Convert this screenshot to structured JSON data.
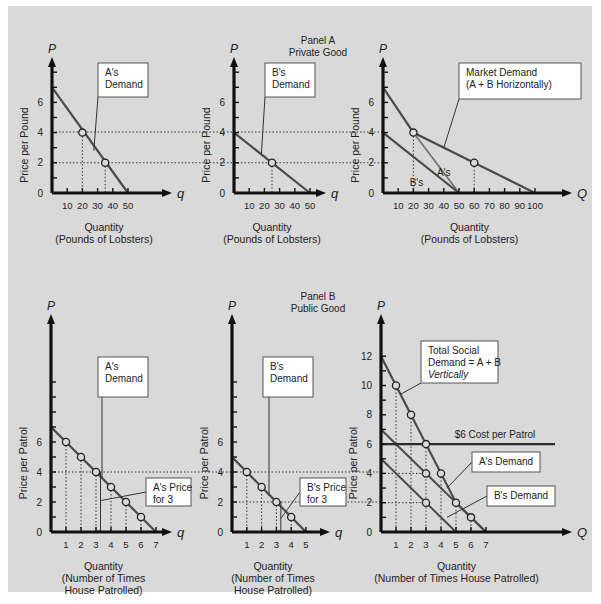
{
  "background": {
    "outer": "#ffffff",
    "panel": "#d9d9d9",
    "line": "#4a4a4a",
    "axis": "#111111",
    "box_fill": "#ffffff",
    "box_stroke": "#555555"
  },
  "panel_titles": [
    {
      "id": "panel-a",
      "lines": [
        "Panel A",
        "Private Good"
      ],
      "x": 318,
      "y": 44
    },
    {
      "id": "panel-b",
      "lines": [
        "Panel B",
        "Public Good"
      ],
      "x": 318,
      "y": 300
    }
  ],
  "chart_data": [
    {
      "id": "a-private-demand",
      "type": "line",
      "title": "A's Demand (Private Good)",
      "ylabel": "Price per Pound",
      "xlabel": "Quantity\n(Pounds of Lobsters)",
      "axis_y_label": "P",
      "axis_x_label": "q",
      "xlim": [
        0,
        50
      ],
      "ylim": [
        0,
        7
      ],
      "xticks": [
        10,
        20,
        30,
        40,
        50
      ],
      "yticks_labeled": [
        0,
        2,
        4,
        6
      ],
      "yticks_minor": [
        1,
        3,
        5,
        7,
        8
      ],
      "series": [
        {
          "name": "A's Demand",
          "points": [
            [
              0,
              7
            ],
            [
              50,
              0
            ]
          ]
        }
      ],
      "markers": [
        [
          20,
          4
        ],
        [
          35,
          2
        ]
      ],
      "guides": [
        {
          "type": "v",
          "x": 20,
          "y": 4
        },
        {
          "type": "v",
          "x": 35,
          "y": 2
        }
      ],
      "annotations": [
        {
          "lines": [
            "A's",
            "Demand"
          ],
          "box": [
            98,
            63,
            50,
            34
          ],
          "pointer_to": [
            27.5,
            2.8
          ]
        }
      ],
      "frame": {
        "ox": 52,
        "oy": 193,
        "px_x": 1.52,
        "px_y": 15.1,
        "top": 57,
        "right": 172
      }
    },
    {
      "id": "b-private-demand",
      "type": "line",
      "title": "B's Demand (Private Good)",
      "ylabel": "Price per Pound",
      "xlabel": "Quantity\n(Pounds of Lobsters)",
      "axis_y_label": "P",
      "axis_x_label": "q",
      "xlim": [
        0,
        50
      ],
      "ylim": [
        0,
        4
      ],
      "xticks": [
        10,
        20,
        30,
        40,
        50
      ],
      "yticks_labeled": [
        0,
        2,
        4,
        6
      ],
      "yticks_minor": [
        1,
        3,
        5,
        7,
        8
      ],
      "series": [
        {
          "name": "B's Demand",
          "points": [
            [
              0,
              4
            ],
            [
              50,
              0
            ]
          ]
        }
      ],
      "markers": [
        [
          25,
          2
        ]
      ],
      "guides": [
        {
          "type": "v",
          "x": 25,
          "y": 2
        }
      ],
      "annotations": [
        {
          "lines": [
            "B's",
            "Demand"
          ],
          "box": [
            265,
            63,
            50,
            34
          ],
          "pointer_to": [
            18,
            2.6
          ]
        }
      ],
      "frame": {
        "ox": 234,
        "oy": 193,
        "px_x": 1.52,
        "px_y": 15.1,
        "top": 57,
        "right": 326
      }
    },
    {
      "id": "market-demand-private",
      "type": "line",
      "title": "Market Demand (A + B Horizontally)",
      "ylabel": "Price per Pound",
      "xlabel": "Quantity\n(Pounds of Lobsters)",
      "axis_y_label": "P",
      "axis_x_label": "Q",
      "xlim": [
        0,
        100
      ],
      "ylim": [
        0,
        7
      ],
      "xticks": [
        10,
        20,
        30,
        40,
        50,
        60,
        70,
        80,
        90,
        100
      ],
      "yticks_labeled": [
        0,
        2,
        4,
        6
      ],
      "yticks_minor": [
        1,
        3,
        5,
        7,
        8
      ],
      "series": [
        {
          "name": "Market Demand",
          "points": [
            [
              0,
              7
            ],
            [
              20,
              4
            ],
            [
              60,
              2
            ],
            [
              100,
              0
            ]
          ],
          "weight": 2.2
        },
        {
          "name": "A's",
          "points": [
            [
              20,
              4
            ],
            [
              50,
              0
            ]
          ],
          "weight": 1.6,
          "light": true
        },
        {
          "name": "B's",
          "points": [
            [
              0,
              4
            ],
            [
              50,
              0
            ]
          ],
          "weight": 2.2
        }
      ],
      "markers": [
        [
          20,
          4
        ],
        [
          60,
          2
        ]
      ],
      "guides": [
        {
          "type": "v",
          "x": 20,
          "y": 4
        },
        {
          "type": "v",
          "x": 60,
          "y": 2
        }
      ],
      "inline_labels": [
        {
          "text": "A's",
          "x": 40,
          "y": 1.1
        },
        {
          "text": "B's",
          "x": 22,
          "y": 0.45
        }
      ],
      "annotations": [
        {
          "lines": [
            "Market Demand",
            "(A + B Horizontally)"
          ],
          "box": [
            459,
            63,
            122,
            36
          ],
          "pointer_to": [
            40,
            3
          ]
        }
      ],
      "frame": {
        "ox": 383,
        "oy": 193,
        "px_x": 1.52,
        "px_y": 15.1,
        "top": 57,
        "right": 572
      }
    },
    {
      "id": "a-public-demand",
      "type": "line",
      "title": "A's Demand (Public Good)",
      "ylabel": "Price per Patrol",
      "xlabel": "Quantity\n(Number of Times\nHouse Patrolled)",
      "axis_y_label": "P",
      "axis_x_label": "q",
      "xlim": [
        0,
        7
      ],
      "ylim": [
        0,
        7
      ],
      "xticks": [
        1,
        2,
        3,
        4,
        5,
        6,
        7
      ],
      "yticks_labeled": [
        0,
        2,
        4,
        6
      ],
      "yticks_minor": [
        1,
        3,
        5,
        7,
        8,
        9,
        10
      ],
      "series": [
        {
          "name": "A's Demand",
          "points": [
            [
              0,
              7
            ],
            [
              7,
              0
            ]
          ]
        }
      ],
      "markers": [
        [
          1,
          6
        ],
        [
          2,
          5
        ],
        [
          3,
          4
        ],
        [
          4,
          3
        ],
        [
          5,
          2
        ],
        [
          6,
          1
        ]
      ],
      "guides": [
        {
          "type": "v",
          "x": 1,
          "y": 6
        },
        {
          "type": "v",
          "x": 2,
          "y": 5
        },
        {
          "type": "v",
          "x": 3,
          "y": 4
        },
        {
          "type": "v",
          "x": 4,
          "y": 3
        },
        {
          "type": "v",
          "x": 5,
          "y": 2
        },
        {
          "type": "v",
          "x": 6,
          "y": 1
        }
      ],
      "bracket": {
        "x": 3.3,
        "y0": 0,
        "y1": 4
      },
      "annotations": [
        {
          "lines": [
            "A's",
            "Demand"
          ],
          "box": [
            98,
            357,
            50,
            40
          ],
          "pointer_to": [
            3.4,
            3.6
          ]
        },
        {
          "lines": [
            "A's Price",
            "for 3"
          ],
          "box": [
            146,
            478,
            45,
            28
          ],
          "pointer_to": [
            3.35,
            2.1
          ]
        }
      ],
      "frame": {
        "ox": 51,
        "oy": 532,
        "px_x": 15.0,
        "px_y": 15.0,
        "top": 314,
        "right": 172
      }
    },
    {
      "id": "b-public-demand",
      "type": "line",
      "title": "B's Demand (Public Good)",
      "ylabel": "Price per Patrol",
      "xlabel": "Quantity\n(Number of Times\nHouse Patrolled)",
      "axis_y_label": "P",
      "axis_x_label": "q",
      "xlim": [
        0,
        5
      ],
      "ylim": [
        0,
        5
      ],
      "xticks": [
        1,
        2,
        3,
        4,
        5
      ],
      "yticks_labeled": [
        0,
        2,
        4,
        6
      ],
      "yticks_minor": [
        1,
        3,
        5,
        7,
        8,
        9,
        10
      ],
      "series": [
        {
          "name": "B's Demand",
          "points": [
            [
              0,
              5
            ],
            [
              5,
              0
            ]
          ]
        }
      ],
      "markers": [
        [
          1,
          4
        ],
        [
          2,
          3
        ],
        [
          3,
          2
        ],
        [
          4,
          1
        ]
      ],
      "guides": [
        {
          "type": "v",
          "x": 1,
          "y": 4
        },
        {
          "type": "v",
          "x": 2,
          "y": 3
        },
        {
          "type": "v",
          "x": 3,
          "y": 2
        },
        {
          "type": "v",
          "x": 4,
          "y": 1
        }
      ],
      "bracket": {
        "x": 3.3,
        "y0": 0,
        "y1": 2
      },
      "annotations": [
        {
          "lines": [
            "B's",
            "Demand"
          ],
          "box": [
            263,
            357,
            50,
            40
          ],
          "pointer_to": [
            2.5,
            2.4
          ]
        },
        {
          "lines": [
            "B's Price",
            "for 3"
          ],
          "box": [
            300,
            478,
            46,
            28
          ],
          "pointer_to": [
            3.3,
            0.9
          ]
        }
      ],
      "frame": {
        "ox": 232,
        "oy": 532,
        "px_x": 14.8,
        "px_y": 15.0,
        "top": 314,
        "right": 330
      }
    },
    {
      "id": "total-social-demand",
      "type": "line",
      "title": "Total Social Demand = A + B Vertically",
      "ylabel": "Price per Patrol",
      "xlabel": "Quantity\n(Number of Times House Patrolled)",
      "axis_y_label": "P",
      "axis_x_label": "Q",
      "xlim": [
        0,
        7
      ],
      "ylim": [
        0,
        12
      ],
      "xticks": [
        1,
        2,
        3,
        4,
        5,
        6,
        7
      ],
      "yticks_labeled": [
        0,
        2,
        4,
        6,
        8,
        10,
        12
      ],
      "yticks_minor": [
        1,
        3,
        5,
        7,
        9,
        11
      ],
      "series": [
        {
          "name": "Total Social Demand",
          "points": [
            [
              0,
              12
            ],
            [
              5,
              2
            ],
            [
              7,
              0
            ]
          ],
          "weight": 2.2
        },
        {
          "name": "A's Demand",
          "points": [
            [
              0,
              7
            ],
            [
              7,
              0
            ]
          ],
          "weight": 2
        },
        {
          "name": "B's Demand",
          "points": [
            [
              0,
              5
            ],
            [
              5,
              0
            ]
          ],
          "weight": 2
        },
        {
          "name": "$6 Cost per Patrol",
          "points": [
            [
              0,
              6
            ],
            [
              11.6,
              6
            ]
          ],
          "weight": 2.2,
          "dark": true
        }
      ],
      "markers": [
        [
          1,
          10
        ],
        [
          2,
          8
        ],
        [
          3,
          6
        ],
        [
          3,
          4
        ],
        [
          4,
          4
        ],
        [
          3,
          2
        ],
        [
          5,
          2
        ],
        [
          6,
          1
        ]
      ],
      "guides": [
        {
          "type": "v",
          "x": 1,
          "y": 10
        },
        {
          "type": "v",
          "x": 2,
          "y": 8
        },
        {
          "type": "v",
          "x": 3,
          "y": 6
        },
        {
          "type": "v",
          "x": 4,
          "y": 4
        },
        {
          "type": "v",
          "x": 5,
          "y": 2
        },
        {
          "type": "v",
          "x": 6,
          "y": 1
        }
      ],
      "inline_labels": [
        {
          "text": "$6 Cost per Patrol",
          "x": 7.6,
          "y": 6.45
        }
      ],
      "annotations": [
        {
          "lines": [
            "Total Social",
            "Demand = A + B",
            "Vertically"
          ],
          "box": [
            421,
            341,
            77,
            42
          ],
          "pointer_to": [
            1.3,
            9.4
          ],
          "italic_last": true
        },
        {
          "lines": [
            "A's Demand"
          ],
          "box": [
            472,
            452,
            68,
            20
          ],
          "pointer_to": [
            4.4,
            3.0
          ]
        },
        {
          "lines": [
            "B's Demand"
          ],
          "box": [
            487,
            486,
            68,
            20
          ],
          "pointer_to": [
            4.4,
            1.0
          ]
        }
      ],
      "frame": {
        "ox": 381,
        "oy": 532,
        "px_x": 15.0,
        "px_y": 14.65,
        "top": 314,
        "right": 572
      }
    }
  ],
  "cross_guides": [
    {
      "from_chart": "a-private-demand",
      "y_px": 132,
      "x0": 52,
      "x1": 383,
      "label": "P = 4"
    },
    {
      "from_chart": "a-private-demand",
      "y_px": 162.8,
      "x0": 52,
      "x1": 383,
      "label": "P = 2"
    },
    {
      "from_chart": "a-public-demand",
      "y_px": 472,
      "x0": 51,
      "x1": 381,
      "label": "P = 4"
    },
    {
      "from_chart": "b-public-demand",
      "y_px": 502,
      "x0": 232,
      "x1": 381,
      "label": "P = 2"
    }
  ]
}
